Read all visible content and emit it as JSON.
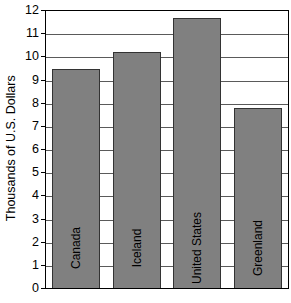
{
  "chart_data": {
    "type": "bar",
    "title": "",
    "subtitle": "",
    "xlabel": "",
    "ylabel": "Thousands of U.S. Dollars",
    "categories": [
      "Canada",
      "Iceland",
      "United States",
      "Greenland"
    ],
    "values": [
      9.45,
      10.2,
      11.65,
      7.75
    ],
    "ylim": [
      0,
      12
    ],
    "ytick_labels": [
      "12",
      "11",
      "10",
      "9",
      "8",
      "7",
      "6",
      "5",
      "4",
      "3",
      "2",
      "1",
      "0"
    ],
    "ytick_values": [
      12,
      11,
      10,
      9,
      8,
      7,
      6,
      5,
      4,
      3,
      2,
      1,
      0
    ],
    "grid": true,
    "legend": "none",
    "bar_color": "#808080",
    "bar_edge_color": "#333333",
    "gridline_color": "#5a5a5a",
    "axis_color": "#000000",
    "background_color": "#ffffff",
    "label_placement": "inside-bar-rotated"
  }
}
